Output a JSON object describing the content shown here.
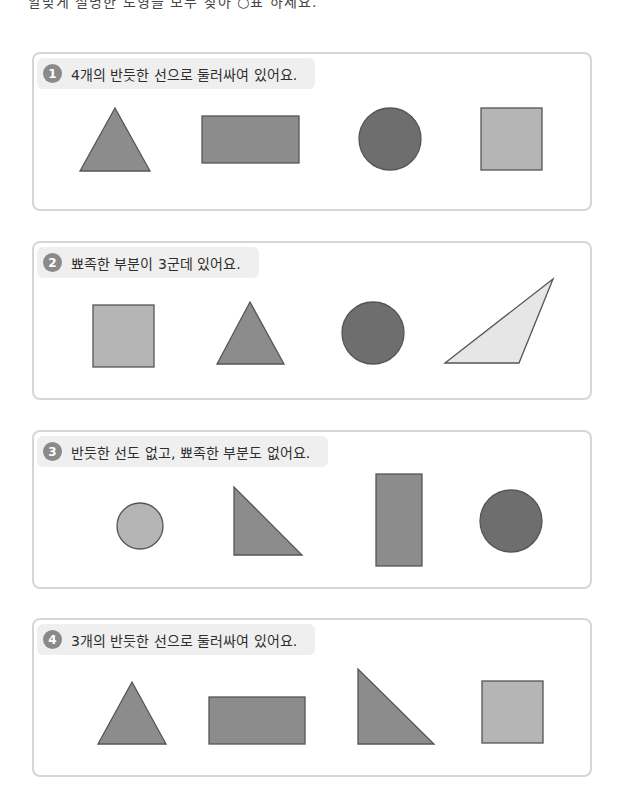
{
  "top_text": "알맞게 설명한 도형을 모두 찾아 ○표 하세요.",
  "colors": {
    "dark": "#6e6e6e",
    "medium": "#8c8c8c",
    "light": "#b5b5b5",
    "very_light": "#e6e6e6",
    "stroke": "#555555",
    "panel_border": "#d6d6d6",
    "header_bg": "#efefef"
  },
  "problems": [
    {
      "number": "1",
      "text": "4개의 반듯한 선으로 둘러싸여 있어요.",
      "shapes": [
        "triangle",
        "rectangle",
        "circle",
        "square"
      ]
    },
    {
      "number": "2",
      "text": "뾰족한 부분이 3군데 있어요.",
      "shapes": [
        "square",
        "triangle",
        "circle",
        "obtuse-triangle"
      ]
    },
    {
      "number": "3",
      "text": "반듯한 선도 없고, 뾰족한 부분도 없어요.",
      "shapes": [
        "circle",
        "right-triangle",
        "tall-rectangle",
        "circle"
      ]
    },
    {
      "number": "4",
      "text": "3개의 반듯한 선으로 둘러싸여 있어요.",
      "shapes": [
        "triangle",
        "rectangle",
        "right-triangle",
        "square"
      ]
    }
  ]
}
